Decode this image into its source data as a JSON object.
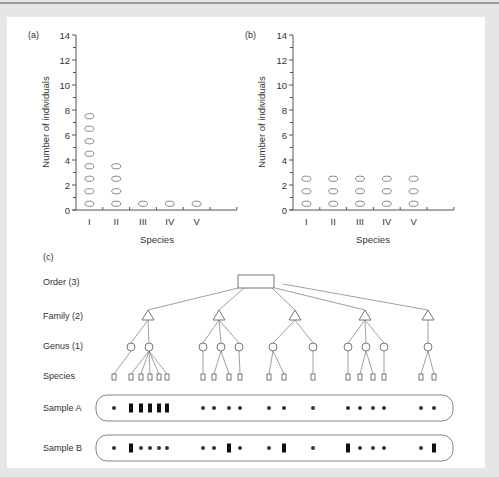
{
  "chart_data": [
    {
      "type": "scatter",
      "panel_label": "(a)",
      "title": "",
      "xlabel": "Species",
      "ylabel": "Number of individuals",
      "categories": [
        "I",
        "II",
        "III",
        "IV",
        "V"
      ],
      "values": [
        8,
        4,
        1,
        1,
        1
      ],
      "ylim": [
        0,
        14
      ],
      "yticks": [
        0,
        2,
        4,
        6,
        8,
        10,
        12,
        14
      ],
      "grid": false,
      "marker": "stacked ovals, one per individual"
    },
    {
      "type": "scatter",
      "panel_label": "(b)",
      "title": "",
      "xlabel": "Species",
      "ylabel": "Number of individuals",
      "categories": [
        "I",
        "II",
        "III",
        "IV",
        "V"
      ],
      "values": [
        3,
        3,
        3,
        3,
        3
      ],
      "ylim": [
        0,
        14
      ],
      "yticks": [
        0,
        2,
        4,
        6,
        8,
        10,
        12,
        14
      ],
      "grid": false,
      "marker": "stacked ovals, one per individual"
    }
  ],
  "diagram": {
    "panel_label": "(c)",
    "levels": {
      "order": "Order (3)",
      "family": "Family (2)",
      "genus": "Genus (1)",
      "species": "Species"
    },
    "tree": [
      [
        1,
        5
      ],
      [
        1,
        2,
        1
      ],
      [
        2,
        1
      ],
      [
        1,
        2,
        1
      ],
      [
        2
      ]
    ],
    "samples": [
      {
        "label": "Sample A",
        "marks": [
          [
            "dot"
          ],
          [
            "bar",
            "bar",
            "bar",
            "bar",
            "bar"
          ],
          [
            "dot"
          ],
          [
            "dot",
            "dot"
          ],
          [
            "dot"
          ],
          [
            "dot",
            "dot"
          ],
          [
            "dot"
          ],
          [
            "dot"
          ],
          [
            "dot",
            "dot"
          ],
          [
            "dot"
          ],
          [
            "dot",
            "dot"
          ]
        ]
      },
      {
        "label": "Sample B",
        "marks": [
          [
            "dot"
          ],
          [
            "bar",
            "dot",
            "dot",
            "dot",
            "dot"
          ],
          [
            "dot"
          ],
          [
            "dot",
            "bar"
          ],
          [
            "dot"
          ],
          [
            "dot",
            "bar"
          ],
          [
            "dot"
          ],
          [
            "bar"
          ],
          [
            "dot",
            "dot"
          ],
          [
            "dot"
          ],
          [
            "dot",
            "bar"
          ]
        ]
      }
    ]
  }
}
